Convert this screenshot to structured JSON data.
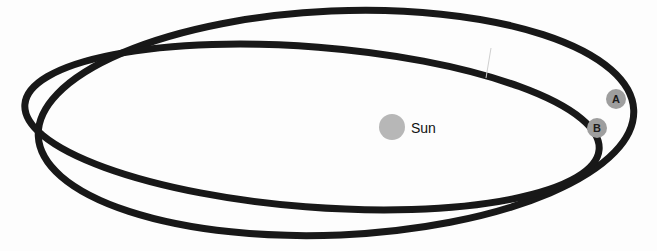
{
  "diagram": {
    "background_color": "#fdfdfd",
    "orbit_stroke_color": "#181818",
    "orbit_stroke_width": 7
  },
  "sun": {
    "label": "Sun",
    "color": "#b7b7b7",
    "cx": 392,
    "cy": 127,
    "r": 13,
    "label_x": 411,
    "label_y": 128
  },
  "markers": [
    {
      "id": "A",
      "label": "A",
      "color": "#9e9e9e",
      "text_color": "#1c1c1c",
      "cx": 616,
      "cy": 99,
      "r": 10
    },
    {
      "id": "B",
      "label": "B",
      "color": "#9e9e9e",
      "text_color": "#1c1c1c",
      "cx": 597,
      "cy": 128,
      "r": 10
    }
  ],
  "orbits": [
    {
      "id": "outer-orbit",
      "name": "tall-ellipse",
      "cx": 336,
      "cy": 123,
      "rx": 298,
      "ry": 112,
      "rotation_deg": -2.5
    },
    {
      "id": "inner-orbit",
      "name": "flat-ellipse",
      "cx": 312,
      "cy": 127,
      "rx": 288,
      "ry": 80,
      "rotation_deg": 4.5
    }
  ],
  "artifacts": [
    {
      "id": "scratch",
      "x1": 491,
      "y1": 48,
      "x2": 486,
      "y2": 78,
      "color": "#cfcfcf"
    }
  ]
}
